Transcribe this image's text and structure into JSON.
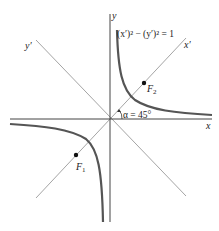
{
  "diagram": {
    "equation": "(x′)² − (y′)² = 1",
    "axes": {
      "x_label": "x",
      "y_label": "y",
      "x_prime_label": "x′",
      "y_prime_label": "y′"
    },
    "angle_label": "α = 45°",
    "foci": [
      {
        "name": "F",
        "sub": "1"
      },
      {
        "name": "F",
        "sub": "2"
      }
    ],
    "colors": {
      "axis": "#444444",
      "rotated_axis": "#999999",
      "curve": "#555555",
      "text": "#222222"
    }
  }
}
